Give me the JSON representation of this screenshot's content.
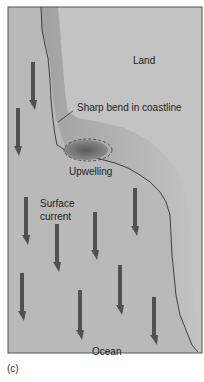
{
  "figure": {
    "panel_label": "(c)",
    "labels": {
      "land": "Land",
      "sharp_bend": "Sharp bend in coastline",
      "upwelling": "Upwelling",
      "surface_current_line1": "Surface",
      "surface_current_line2": "current",
      "ocean": "Ocean"
    },
    "colors": {
      "ocean": "#b9b9b9",
      "land": "#c3c3c3",
      "shelf": "#a8a8a8",
      "arrow": "#505050",
      "upwelling": "#6e6e6e",
      "coastline": "#222222",
      "border": "#555555"
    }
  }
}
